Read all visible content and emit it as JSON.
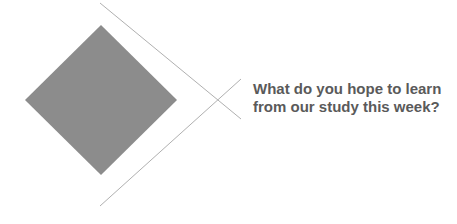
{
  "prompt": {
    "line1": "What do you hope to learn",
    "line2": "from our study this week?"
  },
  "colors": {
    "diamond": "#8c8c8c",
    "lines": "#b0b0b0",
    "text": "#5a5a5a",
    "background": "#ffffff"
  }
}
